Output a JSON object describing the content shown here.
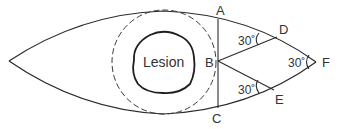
{
  "diagram": {
    "center_label": "Lesion",
    "points": {
      "A": "A",
      "B": "B",
      "C": "C",
      "D": "D",
      "E": "E",
      "F": "F"
    },
    "angles": {
      "at_D": "30˚",
      "at_F": "30˚",
      "at_E": "30˚"
    },
    "colors": {
      "stroke": "#2a2a2a",
      "text": "#333333",
      "background": "#ffffff"
    }
  }
}
